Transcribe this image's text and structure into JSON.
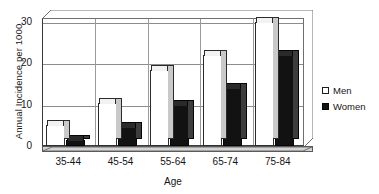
{
  "chart_data": {
    "type": "bar",
    "title": "",
    "xlabel": "Age",
    "ylabel": "Annual Incidence per 1000",
    "categories": [
      "35-44",
      "45-54",
      "55-64",
      "65-74",
      "75-84"
    ],
    "series": [
      {
        "name": "Men",
        "color": "#ffffff",
        "values": [
          5,
          10.5,
          18.5,
          22,
          30
        ]
      },
      {
        "name": "Women",
        "color": "#121212",
        "values": [
          1.5,
          4.5,
          10,
          14,
          22
        ]
      }
    ],
    "ylim": [
      0,
      31
    ],
    "yticks": [
      0,
      10,
      20,
      30
    ],
    "ytick_labels": [
      "0",
      "10",
      "20",
      "30"
    ],
    "grid": "horizontal-and-category-separators",
    "legend_position": "right",
    "style": "3d-column"
  },
  "legend": {
    "items": [
      {
        "label": "Men",
        "marker": "hollow-square"
      },
      {
        "label": "Women",
        "marker": "filled-square"
      }
    ]
  },
  "colors": {
    "men_fill": "#ffffff",
    "women_fill": "#121212",
    "axis": "#3a3a3a",
    "grid": "#8d8d8d",
    "depth_shade": "#c9c9c9",
    "background": "#ffffff"
  }
}
